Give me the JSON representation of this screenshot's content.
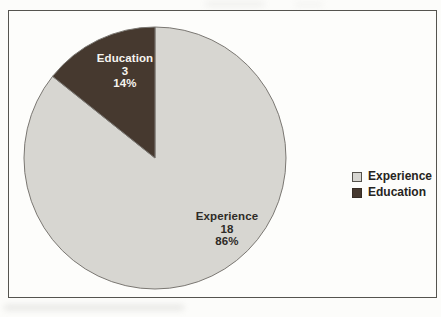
{
  "chart_data": {
    "type": "pie",
    "title": "",
    "total": 21,
    "slices": [
      {
        "name": "Experience",
        "value": 18,
        "pct": "86%",
        "color": "#d7d6d1",
        "label_text_color": "#2e2b27"
      },
      {
        "name": "Education",
        "value": 3,
        "pct": "14%",
        "color": "#46392f",
        "label_text_color": "#f6f4ef"
      }
    ],
    "start_angle_deg": 0,
    "direction": "clockwise",
    "outline_color": "#7a7772",
    "legend_position": "right"
  },
  "legend": {
    "items": [
      {
        "label": "Experience",
        "color": "#d7d6d1",
        "border": "#55524c"
      },
      {
        "label": "Education",
        "color": "#46392f",
        "border": "#362c24"
      }
    ]
  }
}
